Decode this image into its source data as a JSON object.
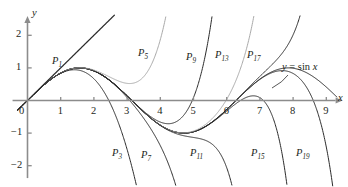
{
  "figure": {
    "kind": "taylor-polynomial-approximation-graph",
    "background": "#ffffff",
    "ink_dark": "#2b2b2b",
    "ink_light": "#a9a9a9",
    "axis_color": "#8c8c8c",
    "text_color": "#231f20"
  },
  "axes": {
    "x_label": "x",
    "y_label": "y",
    "x_ticks": [
      "1",
      "2",
      "3",
      "4",
      "5",
      "6",
      "7",
      "8",
      "9"
    ],
    "x_tick_values": [
      1,
      2,
      3,
      4,
      5,
      6,
      7,
      8,
      9
    ],
    "y_ticks": [
      "2",
      "1",
      "-1",
      "-2"
    ],
    "y_tick_values": [
      2,
      1,
      -1,
      -2
    ],
    "origin_label": "0",
    "x_range": [
      -0.8,
      9.5
    ],
    "y_range": [
      -2.45,
      2.45
    ],
    "grid": false,
    "x_arrow": true,
    "y_arrow": true
  },
  "curve_labels": [
    {
      "base": "P",
      "sub": "1",
      "x": 52,
      "y": 56
    },
    {
      "base": "P",
      "sub": "5",
      "x": 138,
      "y": 48
    },
    {
      "base": "P",
      "sub": "9",
      "x": 186,
      "y": 52
    },
    {
      "base": "P",
      "sub": "13",
      "x": 215,
      "y": 50
    },
    {
      "base": "P",
      "sub": "17",
      "x": 247,
      "y": 50
    },
    {
      "base": "P",
      "sub": "3",
      "x": 112,
      "y": 148
    },
    {
      "base": "P",
      "sub": "7",
      "x": 141,
      "y": 150
    },
    {
      "base": "P",
      "sub": "11",
      "x": 190,
      "y": 148
    },
    {
      "base": "P",
      "sub": "15",
      "x": 251,
      "y": 148
    },
    {
      "base": "P",
      "sub": "19",
      "x": 296,
      "y": 148
    }
  ],
  "function_label": {
    "prefix": "y",
    "equals": "=",
    "name": "sin",
    "arg": "x",
    "full": "y = sin x",
    "x": 282,
    "y": 62
  },
  "chart_data": {
    "type": "line",
    "title": "",
    "xlabel": "x",
    "ylabel": "y",
    "xlim": [
      -0.8,
      9.5
    ],
    "ylim": [
      -2.45,
      2.45
    ],
    "grid": false,
    "legend": "inline-labels",
    "series": [
      {
        "name": "y = sin x",
        "color": "#2b2b2b",
        "width": 1.0,
        "kind": "reference",
        "formula": "sin(x)",
        "points_note": "zeros at 0, pi, 2pi, 3pi; max 1 at pi/2 and 5pi/2; min -1 at 3pi/2"
      },
      {
        "name": "P1",
        "label": "P1",
        "color": "#2b2b2b",
        "width": 1.25,
        "degree": 1,
        "formula": "x"
      },
      {
        "name": "P3",
        "label": "P3",
        "color": "#2b2b2b",
        "width": 1.0,
        "degree": 3,
        "formula": "x - x^3/6"
      },
      {
        "name": "P5",
        "label": "P5",
        "color": "#a9a9a9",
        "width": 1.0,
        "degree": 5,
        "formula": "x - x^3/6 + x^5/120"
      },
      {
        "name": "P7",
        "label": "P7",
        "color": "#2b2b2b",
        "width": 1.0,
        "degree": 7,
        "formula": "x - x^3/6 + x^5/120 - x^7/5040"
      },
      {
        "name": "P9",
        "label": "P9",
        "color": "#2b2b2b",
        "width": 1.0,
        "degree": 9,
        "formula": "sum_{k=0}^{4} (-1)^k x^(2k+1)/(2k+1)!"
      },
      {
        "name": "P11",
        "label": "P11",
        "color": "#2b2b2b",
        "width": 1.0,
        "degree": 11,
        "formula": "sum_{k=0}^{5} (-1)^k x^(2k+1)/(2k+1)!"
      },
      {
        "name": "P13",
        "label": "P13",
        "color": "#a9a9a9",
        "width": 1.0,
        "degree": 13,
        "formula": "sum_{k=0}^{6} (-1)^k x^(2k+1)/(2k+1)!"
      },
      {
        "name": "P15",
        "label": "P15",
        "color": "#2b2b2b",
        "width": 1.0,
        "degree": 15,
        "formula": "sum_{k=0}^{7} (-1)^k x^(2k+1)/(2k+1)!"
      },
      {
        "name": "P17",
        "label": "P17",
        "color": "#2b2b2b",
        "width": 1.0,
        "degree": 17,
        "formula": "sum_{k=0}^{8} (-1)^k x^(2k+1)/(2k+1)!"
      },
      {
        "name": "P19",
        "label": "P19",
        "color": "#2b2b2b",
        "width": 1.0,
        "degree": 19,
        "formula": "sum_{k=0}^{9} (-1)^k x^(2k+1)/(2k+1)!"
      }
    ]
  }
}
